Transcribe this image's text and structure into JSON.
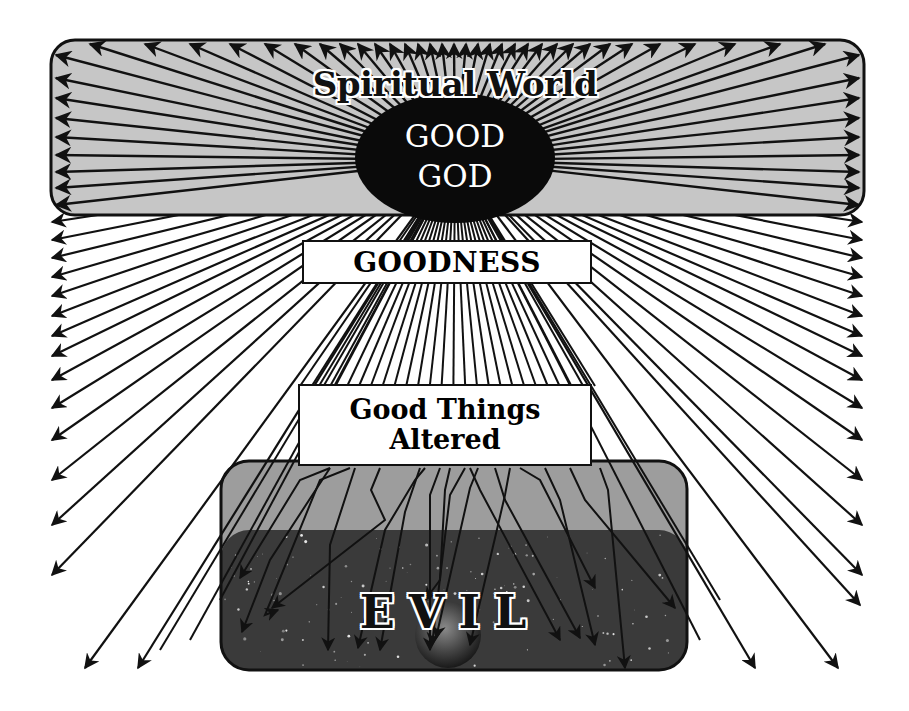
{
  "diagram": {
    "spiritual_world": {
      "title": "Spiritual World",
      "fill": "#c4c4c4",
      "border": "#111111"
    },
    "god": {
      "line1": "GOOD",
      "line2": "GOD",
      "fill": "#0a0a0a",
      "text_color": "#ffffff"
    },
    "goodness": {
      "label": "GOODNESS"
    },
    "good_things_altered": {
      "line1": "Good Things",
      "line2": "Altered"
    },
    "evil": {
      "label": "EVIL",
      "top_fill": "#9a9a9a",
      "space_fill": "#3a3a3a"
    },
    "ray_color": "#111111",
    "origin": [
      455,
      160
    ],
    "rays_top_edge_x": [
      90,
      145,
      190,
      230,
      265,
      295,
      320,
      340,
      358,
      375,
      390,
      405,
      418,
      430,
      442,
      454,
      466,
      478,
      490,
      502,
      515,
      528,
      542,
      557,
      573,
      590,
      610,
      632,
      660,
      695,
      735,
      780,
      825
    ],
    "rays_left_edge_y": [
      55,
      78,
      98,
      118,
      137,
      155,
      172,
      188,
      205,
      222,
      240,
      258,
      277,
      296,
      316,
      336,
      356,
      380,
      408,
      440,
      480,
      525,
      575
    ],
    "rays_right_edge_y": [
      55,
      78,
      98,
      118,
      137,
      155,
      172,
      188,
      205,
      222,
      240,
      258,
      277,
      296,
      316,
      336,
      356,
      380,
      408,
      440,
      480,
      525,
      575
    ],
    "rays_bottom_outer": [
      [
        85,
        668
      ],
      [
        138,
        668
      ],
      [
        755,
        668
      ],
      [
        838,
        668
      ],
      [
        860,
        605
      ]
    ],
    "altered_rays": [
      [
        [
          330,
          468
        ],
        [
          300,
          480
        ],
        [
          240,
          578
        ]
      ],
      [
        [
          330,
          468
        ],
        [
          270,
          560
        ],
        [
          242,
          632
        ]
      ],
      [
        [
          350,
          468
        ],
        [
          320,
          480
        ],
        [
          265,
          615
        ],
        [
          278,
          610
        ]
      ],
      [
        [
          355,
          468
        ],
        [
          330,
          545
        ],
        [
          328,
          650
        ]
      ],
      [
        [
          380,
          468
        ],
        [
          371,
          490
        ],
        [
          385,
          520
        ],
        [
          272,
          608
        ]
      ],
      [
        [
          420,
          468
        ],
        [
          405,
          512
        ],
        [
          380,
          650
        ]
      ],
      [
        [
          425,
          468
        ],
        [
          415,
          480
        ],
        [
          385,
          530
        ],
        [
          358,
          648
        ]
      ],
      [
        [
          440,
          468
        ],
        [
          430,
          495
        ],
        [
          430,
          650
        ]
      ],
      [
        [
          450,
          468
        ],
        [
          445,
          490
        ],
        [
          440,
          580
        ],
        [
          425,
          600
        ]
      ],
      [
        [
          465,
          468
        ],
        [
          450,
          495
        ],
        [
          432,
          645
        ]
      ],
      [
        [
          470,
          468
        ],
        [
          480,
          490
        ],
        [
          560,
          640
        ]
      ],
      [
        [
          478,
          468
        ],
        [
          470,
          488
        ],
        [
          436,
          638
        ]
      ],
      [
        [
          495,
          468
        ],
        [
          505,
          500
        ],
        [
          580,
          638
        ]
      ],
      [
        [
          510,
          468
        ],
        [
          505,
          495
        ],
        [
          470,
          645
        ]
      ],
      [
        [
          520,
          468
        ],
        [
          540,
          480
        ],
        [
          595,
          588
        ]
      ],
      [
        [
          545,
          468
        ],
        [
          560,
          500
        ],
        [
          595,
          645
        ]
      ],
      [
        [
          570,
          468
        ],
        [
          585,
          500
        ],
        [
          675,
          608
        ]
      ],
      [
        [
          600,
          468
        ],
        [
          608,
          490
        ],
        [
          625,
          668
        ]
      ]
    ]
  }
}
